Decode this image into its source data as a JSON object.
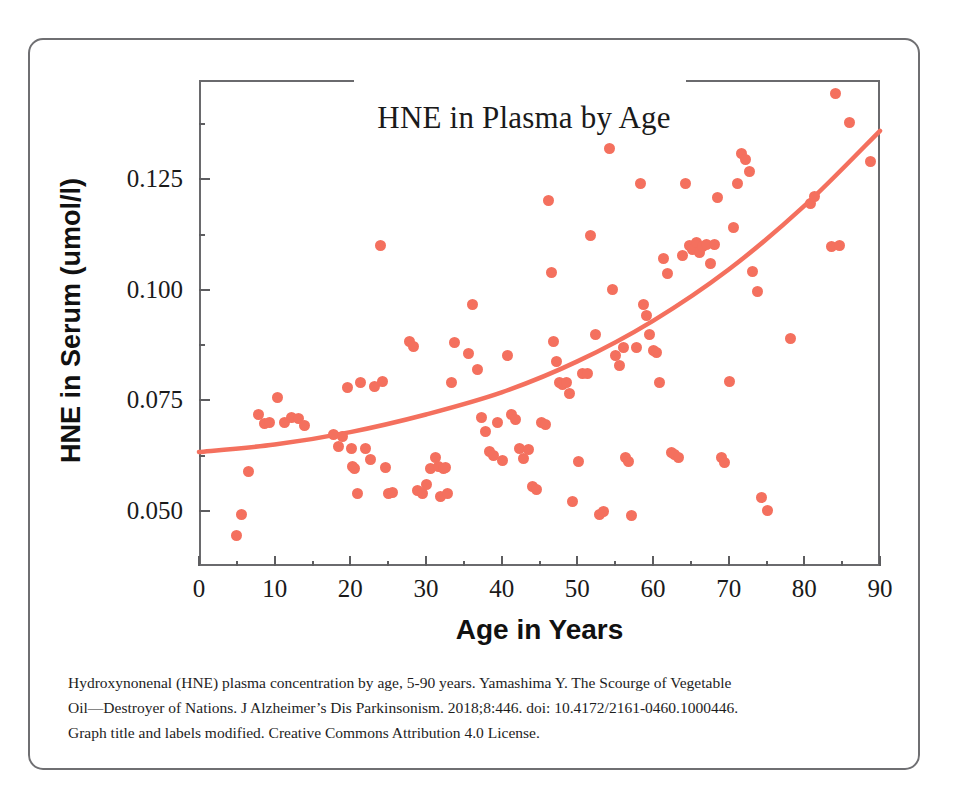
{
  "figure": {
    "title": "HNE in Plasma by Age",
    "x_axis_title": "Age in Years",
    "y_axis_title": "HNE in Serum (umol/l)",
    "accent_color": "#f4705e",
    "frame_color": "#6a6a6d",
    "border_color": "#6f6f72"
  },
  "caption": {
    "line1": "Hydroxynonenal (HNE) plasma concentration by age, 5-90 years.  Yamashima Y. The Scourge of Vegetable",
    "line2": "Oil—Destroyer of Nations. J Alzheimer’s Dis Parkinsonism. 2018;8:446. doi: 10.4172/2161-0460.1000446.",
    "line3": "Graph title and labels modified. Creative Commons Attribution 4.0 License."
  },
  "chart_data": {
    "type": "scatter",
    "title": "HNE in Plasma by Age",
    "xlabel": "Age in Years",
    "ylabel": "HNE in Serum (umol/l)",
    "xlim": [
      0,
      90
    ],
    "ylim": [
      0.0375,
      0.1475
    ],
    "grid": false,
    "legend": null,
    "x_ticks": [
      0,
      10,
      20,
      30,
      40,
      50,
      60,
      70,
      80,
      90
    ],
    "x_tick_labels": [
      "0",
      "10",
      "20",
      "30",
      "40",
      "50",
      "60",
      "70",
      "80",
      "90"
    ],
    "x_minor_tick_step": 5,
    "y_ticks": [
      0.05,
      0.075,
      0.1,
      0.125
    ],
    "y_tick_labels": [
      "0.050",
      "0.075",
      "0.100",
      "0.125"
    ],
    "y_minor_ticks": [
      0.0625,
      0.0875,
      0.1125,
      0.1375
    ],
    "marker": {
      "shape": "circle",
      "color": "#f4705e",
      "size_px": 11
    },
    "series": [
      {
        "name": "HNE plasma concentration",
        "color": "#f4705e",
        "points": [
          [
            5.0,
            0.0445
          ],
          [
            5.6,
            0.0492
          ],
          [
            6.5,
            0.0588
          ],
          [
            7.8,
            0.0718
          ],
          [
            8.6,
            0.0697
          ],
          [
            9.3,
            0.07
          ],
          [
            10.4,
            0.0756
          ],
          [
            11.3,
            0.07
          ],
          [
            12.2,
            0.0712
          ],
          [
            13.1,
            0.0708
          ],
          [
            14.0,
            0.0692
          ],
          [
            17.8,
            0.0672
          ],
          [
            18.4,
            0.0646
          ],
          [
            18.9,
            0.0668
          ],
          [
            19.6,
            0.078
          ],
          [
            20.1,
            0.064
          ],
          [
            20.3,
            0.06
          ],
          [
            20.6,
            0.0596
          ],
          [
            20.9,
            0.054
          ],
          [
            21.4,
            0.079
          ],
          [
            22.0,
            0.064
          ],
          [
            22.6,
            0.0616
          ],
          [
            23.2,
            0.0782
          ],
          [
            24.0,
            0.11
          ],
          [
            24.3,
            0.0792
          ],
          [
            24.6,
            0.0598
          ],
          [
            25.1,
            0.054
          ],
          [
            25.6,
            0.0542
          ],
          [
            27.8,
            0.0884
          ],
          [
            28.4,
            0.0872
          ],
          [
            28.9,
            0.0546
          ],
          [
            29.6,
            0.054
          ],
          [
            30.1,
            0.056
          ],
          [
            30.6,
            0.0596
          ],
          [
            31.2,
            0.062
          ],
          [
            31.6,
            0.06
          ],
          [
            31.9,
            0.0532
          ],
          [
            32.3,
            0.0596
          ],
          [
            32.6,
            0.0598
          ],
          [
            32.9,
            0.0538
          ],
          [
            33.4,
            0.079
          ],
          [
            33.8,
            0.088
          ],
          [
            35.6,
            0.0856
          ],
          [
            36.2,
            0.0966
          ],
          [
            36.8,
            0.082
          ],
          [
            37.4,
            0.0712
          ],
          [
            37.9,
            0.068
          ],
          [
            38.4,
            0.0634
          ],
          [
            38.9,
            0.0624
          ],
          [
            39.5,
            0.07
          ],
          [
            40.1,
            0.0614
          ],
          [
            40.8,
            0.0852
          ],
          [
            41.3,
            0.0718
          ],
          [
            41.8,
            0.0706
          ],
          [
            42.4,
            0.064
          ],
          [
            42.9,
            0.0618
          ],
          [
            43.5,
            0.0638
          ],
          [
            44.1,
            0.0556
          ],
          [
            44.6,
            0.0548
          ],
          [
            45.2,
            0.07
          ],
          [
            45.8,
            0.0696
          ],
          [
            46.2,
            0.1202
          ],
          [
            46.6,
            0.104
          ],
          [
            46.9,
            0.0882
          ],
          [
            47.3,
            0.0838
          ],
          [
            47.7,
            0.079
          ],
          [
            48.1,
            0.0786
          ],
          [
            48.6,
            0.079
          ],
          [
            49.0,
            0.0766
          ],
          [
            49.4,
            0.052
          ],
          [
            50.2,
            0.0612
          ],
          [
            50.7,
            0.081
          ],
          [
            51.3,
            0.081
          ],
          [
            51.8,
            0.1122
          ],
          [
            52.4,
            0.09
          ],
          [
            52.9,
            0.0492
          ],
          [
            53.4,
            0.0498
          ],
          [
            54.2,
            0.132
          ],
          [
            54.7,
            0.1
          ],
          [
            55.1,
            0.0852
          ],
          [
            55.6,
            0.0828
          ],
          [
            56.1,
            0.087
          ],
          [
            56.4,
            0.062
          ],
          [
            56.8,
            0.0612
          ],
          [
            57.2,
            0.049
          ],
          [
            57.8,
            0.087
          ],
          [
            58.3,
            0.124
          ],
          [
            58.8,
            0.0966
          ],
          [
            59.2,
            0.0942
          ],
          [
            59.6,
            0.09
          ],
          [
            60.1,
            0.0862
          ],
          [
            60.4,
            0.0858
          ],
          [
            60.8,
            0.079
          ],
          [
            61.4,
            0.107
          ],
          [
            61.9,
            0.1036
          ],
          [
            62.4,
            0.0632
          ],
          [
            62.9,
            0.0628
          ],
          [
            63.4,
            0.062
          ],
          [
            63.9,
            0.1078
          ],
          [
            64.3,
            0.124
          ],
          [
            64.8,
            0.11
          ],
          [
            65.2,
            0.1092
          ],
          [
            65.7,
            0.1108
          ],
          [
            66.1,
            0.1084
          ],
          [
            66.6,
            0.1098
          ],
          [
            67.1,
            0.1102
          ],
          [
            67.6,
            0.106
          ],
          [
            68.1,
            0.1102
          ],
          [
            68.5,
            0.121
          ],
          [
            69.0,
            0.062
          ],
          [
            69.4,
            0.061
          ],
          [
            70.1,
            0.0792
          ],
          [
            70.6,
            0.1142
          ],
          [
            71.2,
            0.124
          ],
          [
            71.7,
            0.1308
          ],
          [
            72.2,
            0.1296
          ],
          [
            72.7,
            0.1268
          ],
          [
            73.2,
            0.1042
          ],
          [
            73.8,
            0.0996
          ],
          [
            74.3,
            0.053
          ],
          [
            75.1,
            0.05
          ],
          [
            78.2,
            0.089
          ],
          [
            80.8,
            0.1196
          ],
          [
            81.4,
            0.1212
          ],
          [
            83.6,
            0.1098
          ],
          [
            84.1,
            0.1444
          ],
          [
            84.6,
            0.11
          ],
          [
            86.0,
            0.1378
          ],
          [
            88.8,
            0.129
          ]
        ]
      }
    ],
    "trendline": {
      "type": "exponential-fit",
      "color": "#f4705e",
      "points": [
        [
          0,
          0.0633
        ],
        [
          10,
          0.065
        ],
        [
          20,
          0.0678
        ],
        [
          30,
          0.0718
        ],
        [
          40,
          0.0768
        ],
        [
          50,
          0.0838
        ],
        [
          60,
          0.093
        ],
        [
          70,
          0.1046
        ],
        [
          80,
          0.119
        ],
        [
          90,
          0.136
        ]
      ]
    }
  }
}
